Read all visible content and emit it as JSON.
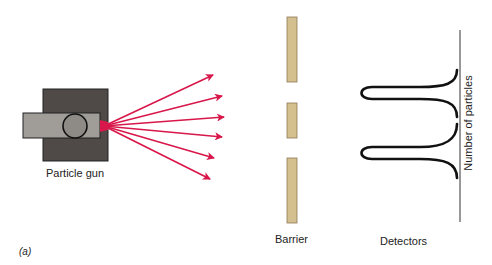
{
  "figure": {
    "label": "(a)",
    "particle_gun": {
      "label": "Particle gun"
    },
    "barrier": {
      "label": "Barrier",
      "slits": 2
    },
    "detectors": {
      "label": "Detectors",
      "axis_label": "Number of particles"
    },
    "colors": {
      "gun_body": "#4f4a47",
      "gun_tube": "#a09c98",
      "arrows": "#d8174a",
      "barrier": "#d4bf8e",
      "curve": "#111111"
    }
  }
}
